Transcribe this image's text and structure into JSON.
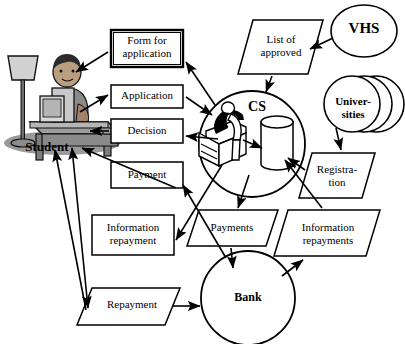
{
  "diagram": {
    "type": "flow-diagram",
    "background": "#ffffff",
    "stroke": "#000000",
    "nodes": [
      {
        "id": "student",
        "label": "Student",
        "shape": "actor-illustration",
        "bold": true
      },
      {
        "id": "form-for-application",
        "label": "Form for\napplication",
        "shape": "rectangle",
        "bold": false
      },
      {
        "id": "application",
        "label": "Application",
        "shape": "rectangle",
        "bold": false
      },
      {
        "id": "decision",
        "label": "Decision",
        "shape": "rectangle",
        "bold": false
      },
      {
        "id": "payment",
        "label": "Payment",
        "shape": "rectangle",
        "bold": false
      },
      {
        "id": "information-repayment",
        "label": "Information\nrepayment",
        "shape": "rectangle",
        "bold": false
      },
      {
        "id": "repayment",
        "label": "Repayment",
        "shape": "parallelogram",
        "bold": false
      },
      {
        "id": "list-of-approved",
        "label": "List of\napproved",
        "shape": "parallelogram",
        "bold": false
      },
      {
        "id": "cs",
        "label": "CS",
        "shape": "circle-process",
        "bold": true
      },
      {
        "id": "vhs",
        "label": "VHS",
        "shape": "ellipse",
        "bold": true
      },
      {
        "id": "universities",
        "label": "Univer-\nsities",
        "shape": "stacked-circles",
        "bold": true
      },
      {
        "id": "registration",
        "label": "Registra-\ntion",
        "shape": "parallelogram",
        "bold": false
      },
      {
        "id": "payments",
        "label": "Payments",
        "shape": "parallelogram",
        "bold": false
      },
      {
        "id": "information-repayments",
        "label": "Information\nrepayments",
        "shape": "parallelogram",
        "bold": false
      },
      {
        "id": "bank",
        "label": "Bank",
        "shape": "circle",
        "bold": true
      }
    ],
    "edges": [
      {
        "from": "form-for-application",
        "to": "student",
        "arrow": "single"
      },
      {
        "from": "student",
        "to": "application",
        "arrow": "single"
      },
      {
        "from": "decision",
        "to": "student",
        "arrow": "single"
      },
      {
        "from": "payment",
        "to": "student",
        "arrow": "single"
      },
      {
        "from": "student",
        "to": "repayment",
        "arrow": "double"
      },
      {
        "from": "cs",
        "to": "form-for-application",
        "arrow": "single"
      },
      {
        "from": "application",
        "to": "cs",
        "arrow": "single"
      },
      {
        "from": "cs",
        "to": "decision",
        "arrow": "single"
      },
      {
        "from": "cs",
        "to": "information-repayment",
        "arrow": "single"
      },
      {
        "from": "bank",
        "to": "payment",
        "arrow": "single"
      },
      {
        "from": "vhs",
        "to": "list-of-approved",
        "arrow": "single"
      },
      {
        "from": "list-of-approved",
        "to": "cs",
        "arrow": "single"
      },
      {
        "from": "universities",
        "to": "registration",
        "arrow": "single"
      },
      {
        "from": "registration",
        "to": "cs-database",
        "arrow": "single"
      },
      {
        "from": "cs",
        "to": "cs-database",
        "arrow": "single"
      },
      {
        "from": "cs",
        "to": "payments",
        "arrow": "single"
      },
      {
        "from": "payments",
        "to": "bank",
        "arrow": "single"
      },
      {
        "from": "bank",
        "to": "information-repayments",
        "arrow": "single"
      },
      {
        "from": "information-repayments",
        "to": "cs-database",
        "arrow": "single"
      },
      {
        "from": "repayment",
        "to": "bank",
        "arrow": "single"
      }
    ]
  }
}
